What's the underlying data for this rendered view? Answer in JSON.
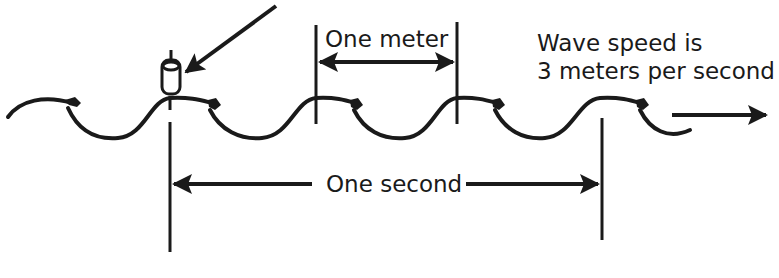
{
  "diagram": {
    "labels": {
      "one_meter": "One meter",
      "wave_speed_line1": "Wave speed is",
      "wave_speed_line2": "3 meters per second",
      "one_second": "One second"
    },
    "elements": {
      "float": "cork-float-on-wave",
      "pointer_arrow": "arrow-pointing-to-float",
      "direction_arrow": "arrow-wave-direction-right",
      "wavelength_marker": "double-arrow-one-meter",
      "period_marker": "double-arrow-one-second"
    },
    "quantities": {
      "wavelength_m": 1,
      "wave_speed_m_per_s": 3,
      "time_s": 1,
      "wavelengths_in_one_second": 3
    },
    "colors": {
      "ink": "#1a1a1a",
      "background": "#ffffff"
    }
  }
}
